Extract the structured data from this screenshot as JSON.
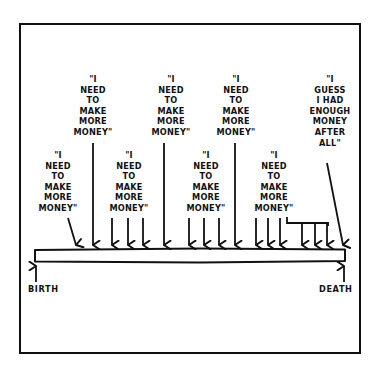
{
  "comic": {
    "ink_color": "#111111",
    "background_color": "#ffffff",
    "quotes": [
      {
        "id": "q-top-1",
        "text": "\"I\nNEED\nTO\nMAKE\nMORE\nMONEY\"",
        "x": 93,
        "y": 74
      },
      {
        "id": "q-top-2",
        "text": "\"I\nNEED\nTO\nMAKE\nMORE\nMONEY\"",
        "x": 171,
        "y": 74
      },
      {
        "id": "q-top-3",
        "text": "\"I\nNEED\nTO\nMAKE\nMORE\nMONEY\"",
        "x": 234,
        "y": 74
      },
      {
        "id": "q-low-1",
        "text": "\"I\nNEED\nTO\nMAKE\nMORE\nMONEY\"",
        "x": 57,
        "y": 150
      },
      {
        "id": "q-low-2",
        "text": "\"I\nNEED\nTO\nMAKE\nMORE\nMONEY\"",
        "x": 129,
        "y": 150
      },
      {
        "id": "q-low-3",
        "text": "\"I\nNEED\nTO\nMAKE\nMORE\nMONEY\"",
        "x": 206,
        "y": 150
      },
      {
        "id": "q-low-4",
        "text": "\"I\nNEED\nTO\nMAKE\nMORE\nMONEY\"",
        "x": 274,
        "y": 150
      },
      {
        "id": "q-final",
        "text": "\"I\nGUESS\nI HAD\nENOUGH\nMONEY\nAFTER\nALL\"",
        "x": 330,
        "y": 74
      }
    ],
    "timeline": {
      "start_label": "BIRTH",
      "end_label": "DEATH"
    },
    "arrows": {
      "diagonal_first": {
        "from": [
          68,
          218
        ],
        "to": [
          76,
          246
        ]
      },
      "long_top": [
        93,
        164,
        235
      ],
      "groups_from_low_quotes": [
        [
          112,
          128,
          143
        ],
        [
          189,
          204,
          219
        ],
        [
          256,
          269,
          280
        ]
      ],
      "bracket": {
        "start_x": 287,
        "y": 226,
        "bar_y": 234,
        "arrows": [
          302,
          315,
          327
        ]
      },
      "diagonal_final": {
        "from": [
          327,
          163
        ],
        "to": [
          343,
          246
        ]
      }
    }
  }
}
